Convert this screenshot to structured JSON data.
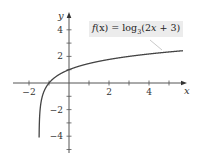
{
  "chart_data": {
    "type": "line",
    "title": "",
    "xlabel": "x",
    "ylabel": "y",
    "xlim": [
      -2.5,
      5.8
    ],
    "ylim": [
      -5.2,
      5.3
    ],
    "grid": false,
    "x_ticks": [
      -2,
      -1,
      1,
      2,
      3,
      4,
      5
    ],
    "x_tick_labels": [
      "-2",
      "2",
      "4"
    ],
    "x_tick_label_values": [
      -2,
      2,
      4
    ],
    "y_ticks": [
      -5,
      -4,
      -3,
      -2,
      -1,
      1,
      2,
      3,
      4
    ],
    "y_tick_labels": [
      "4",
      "2",
      "-2",
      "-4"
    ],
    "y_tick_label_values": [
      4,
      2,
      -2,
      -4
    ],
    "series": [
      {
        "name": "f(x) = log3(2x + 3)",
        "function": "log3(2x + 3)",
        "domain": [
          -1.5,
          5.7
        ],
        "vertical_asymptote": -1.5,
        "key_points": [
          [
            -1,
            0
          ],
          [
            0,
            1
          ],
          [
            3,
            2
          ],
          [
            5.5,
            2.28
          ]
        ]
      }
    ],
    "annotations": [
      {
        "text_prefix": "f(x) = log",
        "subscript": "3",
        "text_suffix": "(2x + 3)",
        "position": "upper right"
      }
    ]
  },
  "axes": {
    "x_label": "x",
    "y_label": "y"
  },
  "label": {
    "prefix": "f",
    "arg": "(x) = log",
    "sub": "3",
    "suffix": "(2",
    "var": "x",
    "end": " + 3)"
  }
}
